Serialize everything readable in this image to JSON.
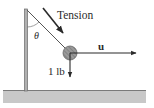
{
  "diagram": {
    "labels": {
      "tension": "Tension",
      "theta": "θ",
      "vector_u": "u",
      "weight": "1 lb"
    },
    "colors": {
      "ink": "#2a2a2a",
      "ground_fill": "#c8c8c8",
      "ground_edge": "#7a7a7a",
      "pole": "#8a8a8a",
      "ball": "#a0a0a0"
    }
  }
}
